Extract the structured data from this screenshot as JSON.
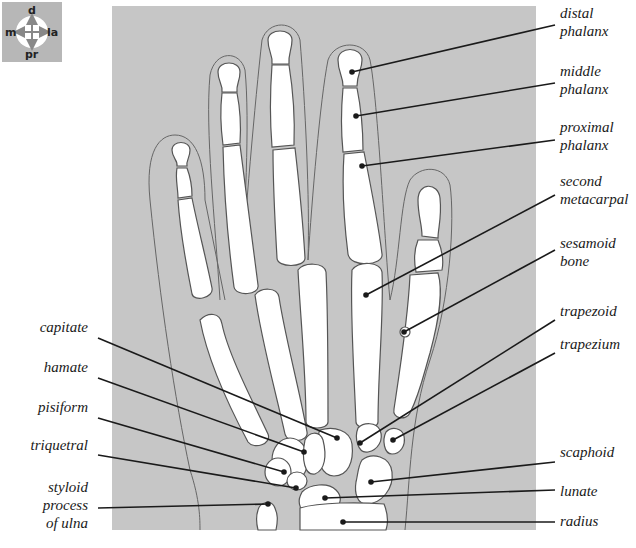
{
  "compass": {
    "top": "d",
    "bottom": "pr",
    "left": "m",
    "right": "la"
  },
  "colors": {
    "panel": "#c6c6c6",
    "bone": "#ffffff",
    "outline": "#555555",
    "leader": "#1a1a1a"
  },
  "labels_right": [
    {
      "id": "distal-phalanx",
      "line1": "distal",
      "line2": "phalanx"
    },
    {
      "id": "middle-phalanx",
      "line1": "middle",
      "line2": "phalanx"
    },
    {
      "id": "proximal-phalanx",
      "line1": "proximal",
      "line2": "phalanx"
    },
    {
      "id": "second-metacarpal",
      "line1": "second",
      "line2": "metacarpal"
    },
    {
      "id": "sesamoid-bone",
      "line1": "sesamoid",
      "line2": "bone"
    },
    {
      "id": "trapezoid",
      "line1": "trapezoid",
      "line2": ""
    },
    {
      "id": "trapezium",
      "line1": "trapezium",
      "line2": ""
    },
    {
      "id": "scaphoid",
      "line1": "scaphoid",
      "line2": ""
    },
    {
      "id": "lunate",
      "line1": "lunate",
      "line2": ""
    },
    {
      "id": "radius",
      "line1": "radius",
      "line2": ""
    }
  ],
  "labels_left": [
    {
      "id": "capitate",
      "line1": "capitate",
      "line2": "",
      "line3": ""
    },
    {
      "id": "hamate",
      "line1": "hamate",
      "line2": "",
      "line3": ""
    },
    {
      "id": "pisiform",
      "line1": "pisiform",
      "line2": "",
      "line3": ""
    },
    {
      "id": "triquetral",
      "line1": "triquetral",
      "line2": "",
      "line3": ""
    },
    {
      "id": "styloid-process-of-ulna",
      "line1": "styloid",
      "line2": "process",
      "line3": "of ulna"
    }
  ]
}
